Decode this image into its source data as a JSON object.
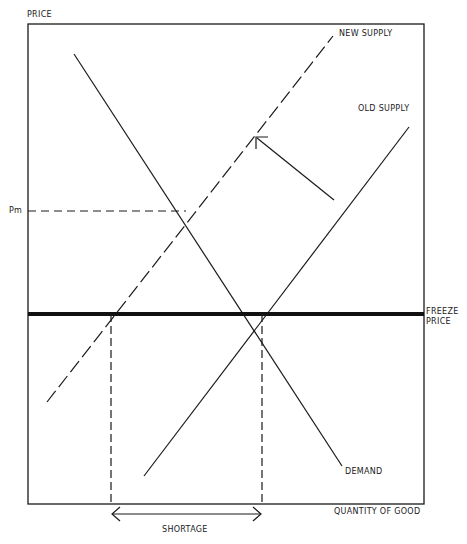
{
  "diagram": {
    "type": "supply-demand",
    "axis_labels": {
      "y": "PRICE",
      "x": "QUANTITY OF GOOD"
    },
    "curve_labels": {
      "new_supply": "NEW SUPPLY",
      "old_supply": "OLD SUPPLY",
      "demand": "DEMAND"
    },
    "price_markers": {
      "pm": "Pm",
      "freeze_line1": "FREEZE",
      "freeze_line2": "PRICE"
    },
    "annotations": {
      "shortage": "SHORTAGE"
    },
    "colors": {
      "ink": "#1a1a1a",
      "background": "#ffffff"
    }
  }
}
